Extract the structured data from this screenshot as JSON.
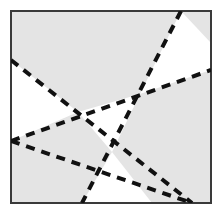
{
  "figure": {
    "title": "Dashed lines partitioning a shaded square",
    "canvas": {
      "width": 223,
      "height": 216,
      "background": "#ffffff"
    },
    "square": {
      "label": "shaded-square",
      "x": 11,
      "y": 11,
      "width": 200,
      "height": 192,
      "fill": "#e4e4e4",
      "stroke": "#3a3a3a",
      "stroke_width": 2
    },
    "line_style": {
      "stroke": "#111111",
      "stroke_width": 4,
      "dash_array": "9 7",
      "linecap": "butt"
    },
    "white_fill": "#ffffff",
    "lines": [
      {
        "name": "line-a-upper-left-to-lower-right",
        "x1": 11,
        "y1": 60,
        "x2": 192,
        "y2": 203
      },
      {
        "name": "line-b-lower-left-to-upper-right",
        "x1": 11,
        "y1": 141,
        "x2": 211,
        "y2": 70
      },
      {
        "name": "line-c-top-to-bottom-left",
        "x1": 181,
        "y1": 11,
        "x2": 82,
        "y2": 203
      },
      {
        "name": "line-d-mid-left-to-bottom-right",
        "x1": 11,
        "y1": 141,
        "x2": 192,
        "y2": 203
      }
    ],
    "white_regions": [
      {
        "name": "white-region-left",
        "points": "11,60 78,112 11,141"
      },
      {
        "name": "white-region-top-right",
        "points": "181,11 211,43 211,70 140,94"
      },
      {
        "name": "white-region-center",
        "points": "78,112 140,94 112,152"
      },
      {
        "name": "white-region-bottom",
        "points": "112,152 152,203 82,203"
      }
    ],
    "intersections": [
      {
        "name": "intersection-left",
        "x": 78,
        "y": 112
      },
      {
        "name": "intersection-right",
        "x": 140,
        "y": 94
      },
      {
        "name": "intersection-lower",
        "x": 112,
        "y": 152
      }
    ]
  }
}
